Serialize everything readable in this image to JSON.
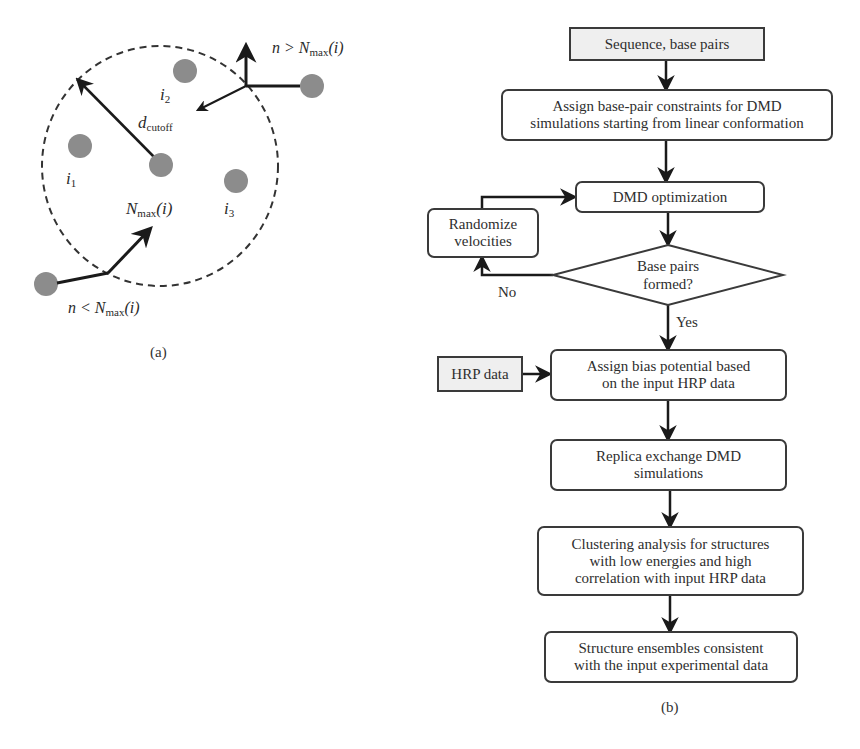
{
  "panel_a": {
    "caption": "(a)",
    "labels": {
      "d_cutoff_main": "d",
      "d_cutoff_sub": "cutoff",
      "i1_main": "i",
      "i1_sub": "1",
      "i2_main": "i",
      "i2_sub": "2",
      "i3_main": "i",
      "i3_sub": "3",
      "nmax_center_N": "N",
      "nmax_center_sub": "max",
      "nmax_center_arg": "(i)",
      "top_right_prefix": "n > N",
      "top_right_sub": "max",
      "top_right_arg": "(i)",
      "bottom_left_prefix": "n < N",
      "bottom_left_sub": "max",
      "bottom_left_arg": "(i)"
    },
    "colors": {
      "dot": "#8c8c8c",
      "line": "#1a1a1a",
      "circle": "#333333"
    }
  },
  "panel_b": {
    "caption": "(b)",
    "nodes": {
      "input_sequence": "Sequence, base pairs",
      "assign_constraints": [
        "Assign base-pair constraints for DMD",
        "simulations starting from linear conformation"
      ],
      "dmd_optimization": "DMD optimization",
      "randomize_velocities": [
        "Randomize",
        "velocities"
      ],
      "decision_base_pairs": [
        "Base pairs",
        "formed?"
      ],
      "hrp_data": "HRP data",
      "assign_bias": [
        "Assign bias potential based",
        "on the input HRP data"
      ],
      "replica_exchange": [
        "Replica exchange DMD",
        "simulations"
      ],
      "clustering": [
        "Clustering analysis for structures",
        "with low energies and high",
        "correlation with input HRP data"
      ],
      "structure_ensembles": [
        "Structure ensembles consistent",
        "with the input experimental data"
      ]
    },
    "edge_labels": {
      "no": "No",
      "yes": "Yes"
    },
    "colors": {
      "border": "#3a3a3a",
      "input_fill": "#efefef",
      "box_fill": "#ffffff",
      "arrow": "#1a1a1a"
    }
  }
}
